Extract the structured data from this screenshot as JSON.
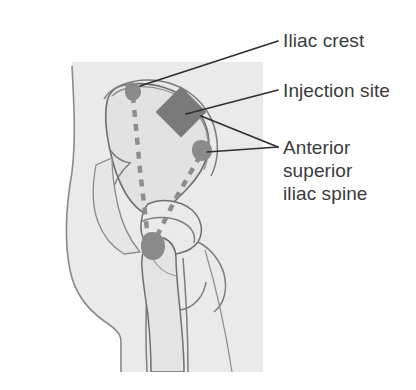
{
  "figure": {
    "background_color": "#ffffff",
    "view": "lateral view of hip and pelvis"
  },
  "labels": [
    {
      "id": "iliac-crest",
      "text": "Iliac crest",
      "lines": [
        "Iliac crest"
      ]
    },
    {
      "id": "injection-site",
      "text": "Injection site",
      "lines": [
        "Injection site"
      ]
    },
    {
      "id": "anterior-superior-iliac-spine",
      "text": "Anterior\nsuperior\niliac spine",
      "lines": [
        "Anterior",
        "superior",
        "iliac spine"
      ]
    }
  ],
  "colors": {
    "text": "#3a3a3a",
    "leader_line": "#2e2e2e",
    "skin_fill": "#eaeaea",
    "body_outline": "#7c7c7c",
    "bone_fill": "#e2e2e2",
    "bone_outline": "#6f6f6f",
    "marker": "#8a8a8a",
    "injection_marker": "#7a7a7a",
    "dashed_guide": "#8d8d8d"
  },
  "markers": [
    {
      "id": "iliac-crest-marker",
      "shape": "blob",
      "x": 131,
      "y": 89
    },
    {
      "id": "injection-site-marker",
      "shape": "diamond",
      "x": 181,
      "y": 112
    },
    {
      "id": "asis-marker",
      "shape": "blob",
      "x": 201,
      "y": 149
    },
    {
      "id": "greater-trochanter-marker",
      "shape": "blob",
      "x": 152,
      "y": 245
    }
  ],
  "guides": [
    {
      "id": "vertical-dashed-guide",
      "from": "iliac crest",
      "to": "greater trochanter"
    },
    {
      "id": "diagonal-dashed-guide",
      "from": "anterior superior iliac spine",
      "to": "greater trochanter"
    }
  ]
}
